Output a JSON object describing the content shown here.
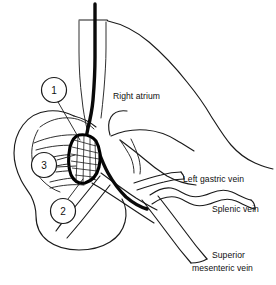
{
  "figure": {
    "background_color": "#ffffff",
    "ink_color": "#1a1a1a",
    "catheter_color": "#0a0a0a"
  },
  "annotations": {
    "right_atrium": "Right atrium",
    "left_gastric_vein": "Left gastric vein",
    "splenic_vein": "Splenic vein",
    "superior_mesenteric_line1": "Superior",
    "superior_mesenteric_line2": "mesenteric vein"
  },
  "callouts": [
    {
      "id": "callout-1",
      "label": "1",
      "cx": 54,
      "cy": 90,
      "r": 12.5
    },
    {
      "id": "callout-3",
      "label": "3",
      "cx": 44,
      "cy": 165,
      "r": 12.5
    },
    {
      "id": "callout-2",
      "label": "2",
      "cx": 63,
      "cy": 211,
      "r": 12.5
    }
  ]
}
